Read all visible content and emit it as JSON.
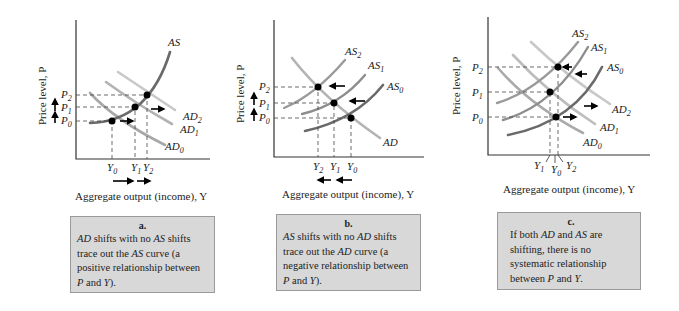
{
  "panels": [
    {
      "id": "a",
      "y_axis_label": "Price level, P",
      "x_axis_label": "Aggregate output (income), Y",
      "curves": {
        "as": [
          "AS"
        ],
        "ad": [
          "AD",
          "AD",
          "AD"
        ]
      },
      "curve_labels": [
        {
          "base": "AS",
          "sub": ""
        },
        {
          "base": "AD",
          "sub": "2"
        },
        {
          "base": "AD",
          "sub": "1"
        },
        {
          "base": "AD",
          "sub": "0"
        }
      ],
      "p_labels": [
        {
          "base": "P",
          "sub": "2"
        },
        {
          "base": "P",
          "sub": "1"
        },
        {
          "base": "P",
          "sub": "0"
        }
      ],
      "y_labels": [
        {
          "base": "Y",
          "sub": "0"
        },
        {
          "base": "Y",
          "sub": "1"
        },
        {
          "base": "Y",
          "sub": "2"
        }
      ],
      "caption_letter": "a.",
      "caption_parts": [
        {
          "t": "AD",
          "i": true
        },
        {
          "t": " shifts with no ",
          "i": false
        },
        {
          "t": "AS",
          "i": true
        },
        {
          "t": " shifts trace out the ",
          "i": false
        },
        {
          "t": "AS",
          "i": true
        },
        {
          "t": " curve (a positive relationship between ",
          "i": false
        },
        {
          "t": "P",
          "i": true
        },
        {
          "t": " and ",
          "i": false
        },
        {
          "t": "Y",
          "i": true
        },
        {
          "t": ").",
          "i": false
        }
      ]
    },
    {
      "id": "b",
      "y_axis_label": "Price level, P",
      "x_axis_label": "Aggregate output (income), Y",
      "curve_labels": [
        {
          "base": "AS",
          "sub": "2"
        },
        {
          "base": "AS",
          "sub": "1"
        },
        {
          "base": "AS",
          "sub": "0"
        },
        {
          "base": "AD",
          "sub": ""
        }
      ],
      "p_labels": [
        {
          "base": "P",
          "sub": "2"
        },
        {
          "base": "P",
          "sub": "1"
        },
        {
          "base": "P",
          "sub": "0"
        }
      ],
      "y_labels": [
        {
          "base": "Y",
          "sub": "2"
        },
        {
          "base": "Y",
          "sub": "1"
        },
        {
          "base": "Y",
          "sub": "0"
        }
      ],
      "caption_letter": "b.",
      "caption_parts": [
        {
          "t": "AS",
          "i": true
        },
        {
          "t": " shifts with no ",
          "i": false
        },
        {
          "t": "AD",
          "i": true
        },
        {
          "t": " shifts trace out the ",
          "i": false
        },
        {
          "t": "AD",
          "i": true
        },
        {
          "t": " curve (a negative relationship between ",
          "i": false
        },
        {
          "t": "P",
          "i": true
        },
        {
          "t": " and ",
          "i": false
        },
        {
          "t": "Y",
          "i": true
        },
        {
          "t": ").",
          "i": false
        }
      ]
    },
    {
      "id": "c",
      "y_axis_label": "Price level, P",
      "x_axis_label": "Aggregate output (income), Y",
      "curve_labels": [
        {
          "base": "AS",
          "sub": "2"
        },
        {
          "base": "AS",
          "sub": "1"
        },
        {
          "base": "AS",
          "sub": "0"
        },
        {
          "base": "AD",
          "sub": "2"
        },
        {
          "base": "AD",
          "sub": "1"
        },
        {
          "base": "AD",
          "sub": "0"
        }
      ],
      "p_labels": [
        {
          "base": "P",
          "sub": "2"
        },
        {
          "base": "P",
          "sub": "1"
        },
        {
          "base": "P",
          "sub": "0"
        }
      ],
      "y_labels": [
        {
          "base": "Y",
          "sub": "1"
        },
        {
          "base": "Y",
          "sub": "0"
        },
        {
          "base": "Y",
          "sub": "2"
        }
      ],
      "caption_letter": "c.",
      "caption_parts": [
        {
          "t": "If both ",
          "i": false
        },
        {
          "t": "AD",
          "i": true
        },
        {
          "t": " and ",
          "i": false
        },
        {
          "t": "AS",
          "i": true
        },
        {
          "t": " are shifting, there is no systematic relationship between ",
          "i": false
        },
        {
          "t": "P",
          "i": true
        },
        {
          "t": " and ",
          "i": false
        },
        {
          "t": "Y",
          "i": true
        },
        {
          "t": ".",
          "i": false
        }
      ]
    }
  ]
}
